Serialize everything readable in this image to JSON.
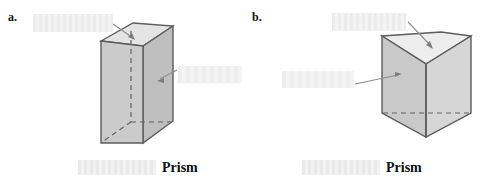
{
  "page": {
    "background_color": "#ffffff",
    "width": 491,
    "height": 192,
    "document_type": "geometry worksheet figure"
  },
  "palette": {
    "outline": "#5a5a5a",
    "outline_dark": "#4a4a4a",
    "face_front": "#c9c9c9",
    "face_side": "#bdbdbd",
    "face_top": "#e2e2e2",
    "face_top_light": "#ededed",
    "hidden_edge": "#6a6a6a",
    "arrow": "#8a8a8a",
    "blank_fill": "#ededed",
    "text": "#111111"
  },
  "items": [
    {
      "id": "a",
      "letter": "a.",
      "shape_name": "rectangular-prism",
      "shape_description": "rectangular prism (cuboid) drawn in oblique projection with dashed hidden edges",
      "labels": [
        {
          "name": "top-face-label",
          "text": "",
          "state": "blank",
          "position": "upper-left",
          "points_to": "top face",
          "width": 80,
          "height": 18
        },
        {
          "name": "side-face-label",
          "text": "",
          "state": "blank",
          "position": "right",
          "points_to": "right side face",
          "width": 64,
          "height": 17
        }
      ],
      "caption": {
        "blank_text": "",
        "blank_state": "blank",
        "blank_width": 78,
        "word": "Prism"
      }
    },
    {
      "id": "b",
      "letter": "b.",
      "shape_name": "triangular-prism",
      "shape_description": "triangular prism standing upright, vertical edge facing viewer, with dashed hidden base edge",
      "labels": [
        {
          "name": "top-face-label",
          "text": "",
          "state": "blank",
          "position": "top",
          "points_to": "top triangular face",
          "width": 74,
          "height": 18
        },
        {
          "name": "lateral-face-label",
          "text": "",
          "state": "blank",
          "position": "left",
          "points_to": "left lateral face",
          "width": 72,
          "height": 17
        }
      ],
      "caption": {
        "blank_text": "",
        "blank_state": "blank",
        "blank_width": 78,
        "word": "Prism"
      }
    }
  ]
}
